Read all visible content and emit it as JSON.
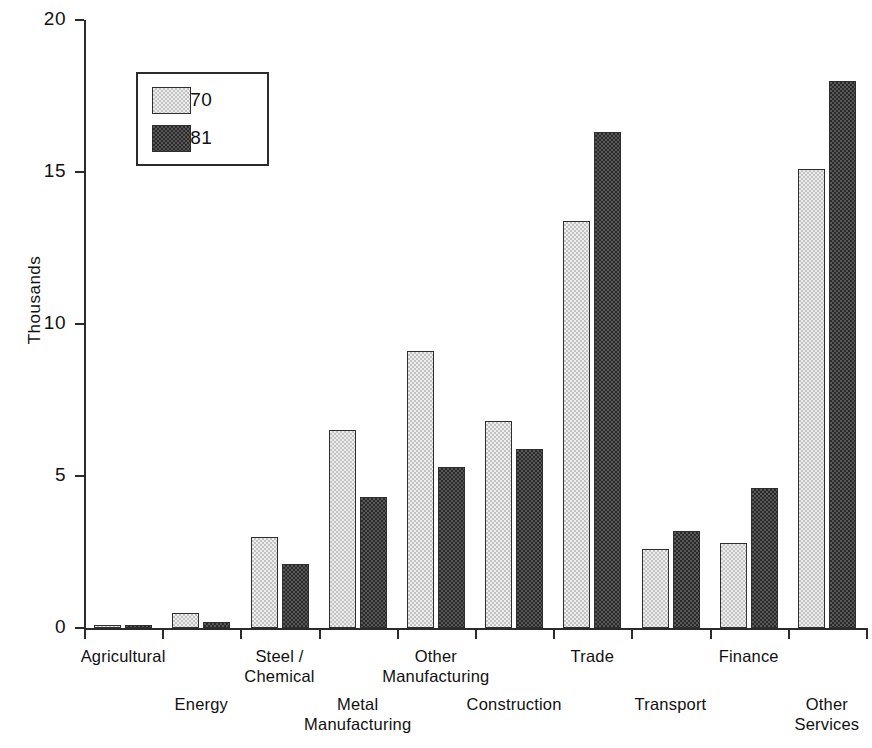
{
  "chart_data": {
    "type": "bar",
    "title": "",
    "subtitle": "",
    "xlabel": "",
    "ylabel": "Thousands",
    "ylim": [
      0,
      20
    ],
    "yticks": [
      0,
      5,
      10,
      15,
      20
    ],
    "ytick_labels": [
      "0",
      "5",
      "10",
      "15",
      "20"
    ],
    "grid": false,
    "legend_position": "upper-left-inside",
    "categories": [
      "Agricultural",
      "Energy",
      "Steel /\nChemical",
      "Metal\nManufacturing",
      "Other\nManufacturing",
      "Construction",
      "Trade",
      "Transport",
      "Finance",
      "Other\nServices"
    ],
    "series": [
      {
        "name": "1970",
        "values": [
          0.1,
          0.5,
          3.0,
          6.5,
          9.1,
          6.8,
          13.4,
          2.6,
          2.8,
          15.1
        ],
        "color": "#d9d9d9",
        "pattern": "light-dotted"
      },
      {
        "name": "1981",
        "values": [
          0.1,
          0.2,
          2.1,
          4.3,
          5.3,
          5.9,
          16.3,
          3.2,
          4.6,
          18.0
        ],
        "color": "#3d3d3d",
        "pattern": "dark-checkered"
      }
    ]
  },
  "legend": {
    "entries": [
      {
        "label": "1970"
      },
      {
        "label": "1981"
      }
    ]
  },
  "axis": {
    "y_title": "Thousands"
  }
}
